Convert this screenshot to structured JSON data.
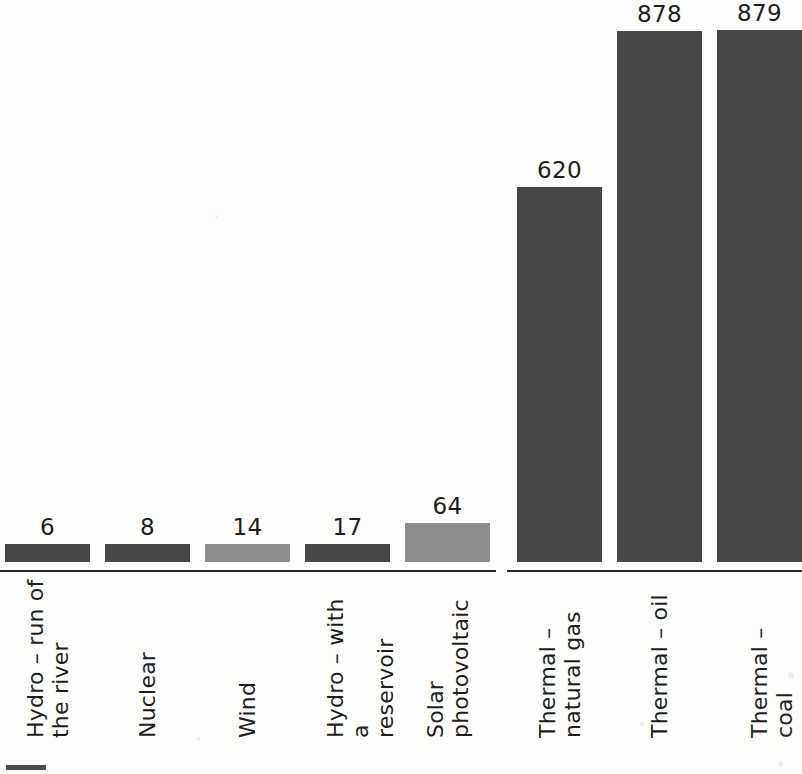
{
  "chart_data": {
    "type": "bar",
    "title": "",
    "subtitle": "",
    "xlabel": "",
    "ylabel": "",
    "ylim": [
      0,
      920
    ],
    "grid": false,
    "legend_position": "bottom-left",
    "value_labels_shown": true,
    "categories": [
      "Hydro – run of\nthe river",
      "Nuclear",
      "Wind",
      "Hydro – with a\nreservoir",
      "Solar\nphotovoltaic",
      "Thermal –\nnatural gas",
      "Thermal – oil",
      "Thermal – coal"
    ],
    "values": [
      6,
      8,
      14,
      17,
      64,
      620,
      878,
      879
    ],
    "bar_shades": [
      "dark",
      "dark",
      "light",
      "dark",
      "light",
      "dark",
      "dark",
      "dark"
    ],
    "group_break_after_index": 4,
    "colors": {
      "dark": "#474747",
      "light": "#8d8d8d",
      "axis": "#2a2a2a",
      "text": "#1d1d1d",
      "background": "#fdfdfc"
    }
  },
  "bars": [
    {
      "label": "Hydro – run of\nthe river",
      "value": "6",
      "shade": "dark"
    },
    {
      "label": "Nuclear",
      "value": "8",
      "shade": "dark"
    },
    {
      "label": "Wind",
      "value": "14",
      "shade": "light"
    },
    {
      "label": "Hydro – with a\nreservoir",
      "value": "17",
      "shade": "dark"
    },
    {
      "label": "Solar\nphotovoltaic",
      "value": "64",
      "shade": "light"
    },
    {
      "label": "Thermal –\nnatural gas",
      "value": "620",
      "shade": "dark"
    },
    {
      "label": "Thermal – oil",
      "value": "878",
      "shade": "dark"
    },
    {
      "label": "Thermal – coal",
      "value": "879",
      "shade": "dark"
    }
  ]
}
